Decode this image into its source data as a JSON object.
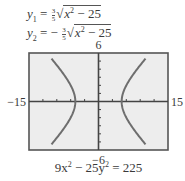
{
  "equations": {
    "y1": {
      "lhs": "y",
      "sub": "1",
      "sign": "=",
      "frac_num": "3",
      "frac_den": "5",
      "radicand_var": "x",
      "radicand_pow": "2",
      "radicand_rest": " − 25"
    },
    "y2": {
      "lhs": "y",
      "sub": "2",
      "sign": "= −",
      "frac_num": "3",
      "frac_den": "5",
      "radicand_var": "x",
      "radicand_pow": "2",
      "radicand_rest": " − 25"
    }
  },
  "caption": {
    "a": "9x",
    "pa": "2",
    "b": " − 25y",
    "pb": "2",
    "c": " = 225"
  },
  "chart_data": {
    "type": "line",
    "title": "",
    "relation": "9x^2 - 25y^2 = 225",
    "functions": [
      "y1 = (3/5)sqrt(x^2 - 25)",
      "y2 = -(3/5)sqrt(x^2 - 25)"
    ],
    "xlim": [
      -15,
      15
    ],
    "ylim": [
      -6,
      6
    ],
    "x_tick_step": 3,
    "y_tick_step": 1,
    "window_labels": {
      "xmin": "−15",
      "xmax": "15",
      "ymin": "−6",
      "ymax": "6"
    },
    "grid": false,
    "colors": {
      "curve": "#6e6e6e",
      "frame": "#555555",
      "plot_bg": "#ededed",
      "axis": "#444444"
    }
  }
}
